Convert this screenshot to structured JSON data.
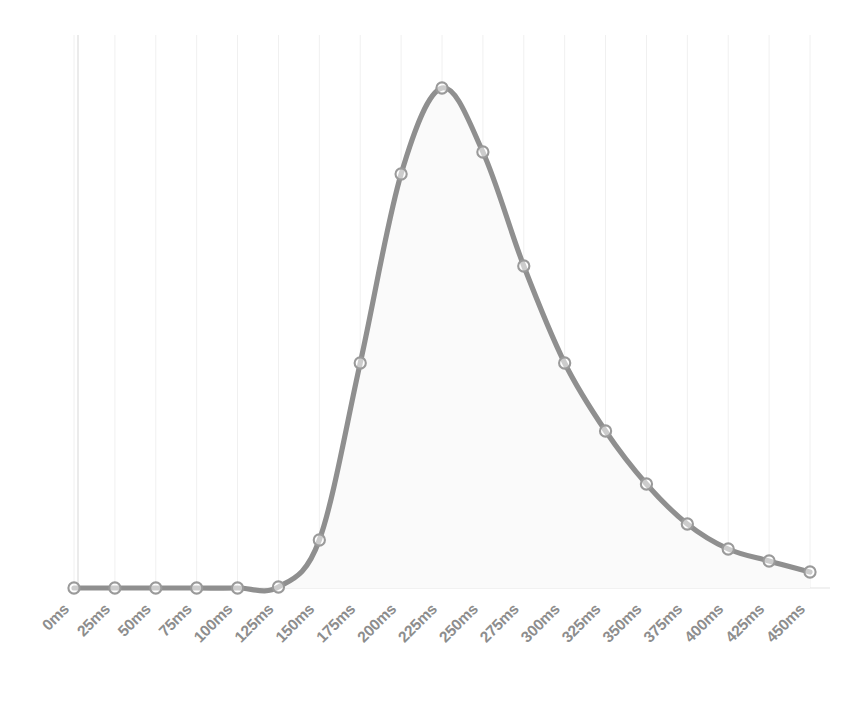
{
  "chart_data": {
    "type": "area",
    "title": "",
    "subtitle": "",
    "xlabel": "",
    "ylabel": "",
    "grid": "vertical-only",
    "legend": "none",
    "marker": "open-circle",
    "line_color": "#8f8f8f",
    "fill_color": "#fafafa",
    "grid_color": "#f0f0f0",
    "axis_color": "#e3e3e3",
    "label_color": "#8d8d8d",
    "label_rotation_deg": -45,
    "xlim": [
      0,
      450
    ],
    "ylim": [
      0,
      100
    ],
    "x_tick_step": 25,
    "categories": [
      "0ms",
      "25ms",
      "50ms",
      "75ms",
      "100ms",
      "125ms",
      "150ms",
      "175ms",
      "200ms",
      "225ms",
      "250ms",
      "275ms",
      "300ms",
      "325ms",
      "350ms",
      "375ms",
      "400ms",
      "425ms",
      "450ms"
    ],
    "x": [
      0,
      25,
      50,
      75,
      100,
      125,
      150,
      175,
      200,
      225,
      250,
      275,
      300,
      325,
      350,
      375,
      400,
      425,
      450
    ],
    "values": [
      0,
      0,
      0,
      0,
      0,
      0.2,
      9.6,
      45.0,
      82.8,
      100.0,
      87.2,
      64.4,
      45.0,
      31.4,
      20.8,
      12.8,
      7.8,
      5.4,
      3.2
    ]
  },
  "axis": {
    "tick_labels": [
      "0ms",
      "25ms",
      "50ms",
      "75ms",
      "100ms",
      "125ms",
      "150ms",
      "175ms",
      "200ms",
      "225ms",
      "250ms",
      "275ms",
      "300ms",
      "325ms",
      "350ms",
      "375ms",
      "400ms",
      "425ms",
      "450ms"
    ]
  }
}
